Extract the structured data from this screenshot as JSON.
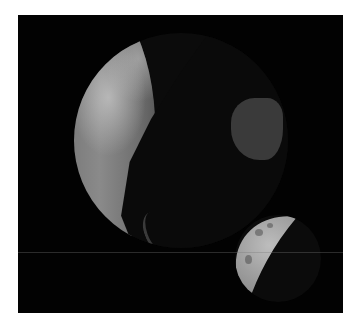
{
  "scene": {
    "description": "3D rendered Earth and Moon on black background",
    "background_color": "#020202",
    "border_color": "#ffffff",
    "objects": [
      {
        "name": "earth",
        "shading": "terminator, partially lit from left"
      },
      {
        "name": "moon",
        "shading": "crescent, lit from upper-left"
      }
    ]
  }
}
